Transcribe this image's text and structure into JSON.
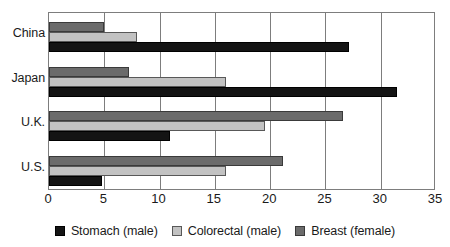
{
  "chart_data": {
    "type": "bar",
    "orientation": "horizontal",
    "title": "",
    "subtitle": "",
    "xlabel": "",
    "ylabel": "",
    "categories": [
      "China",
      "Japan",
      "U.K.",
      "U.S."
    ],
    "series": [
      {
        "name": "Stomach (male)",
        "color": "#141414",
        "values": [
          27.1,
          31.5,
          10.9,
          4.8
        ]
      },
      {
        "name": "Colorectal (male)",
        "color": "#c2c2c2",
        "values": [
          8.0,
          16.0,
          19.5,
          16.0
        ]
      },
      {
        "name": "Breast (female)",
        "color": "#6b6b6b",
        "values": [
          5.0,
          7.2,
          26.6,
          21.2
        ]
      }
    ],
    "series_draw_order": [
      "Breast (female)",
      "Colorectal (male)",
      "Stomach (male)"
    ],
    "xlim": [
      0,
      35
    ],
    "xticks": [
      0,
      5,
      10,
      15,
      20,
      25,
      30,
      35
    ],
    "xtick_labels": [
      "0",
      "5",
      "10",
      "15",
      "20",
      "25",
      "30",
      "35"
    ],
    "grid": true,
    "grid_axis": "x",
    "grid_color": "#7d7d7d",
    "legend_position": "bottom",
    "plot_border_color": "#7d7d7d",
    "background": "#ffffff"
  }
}
